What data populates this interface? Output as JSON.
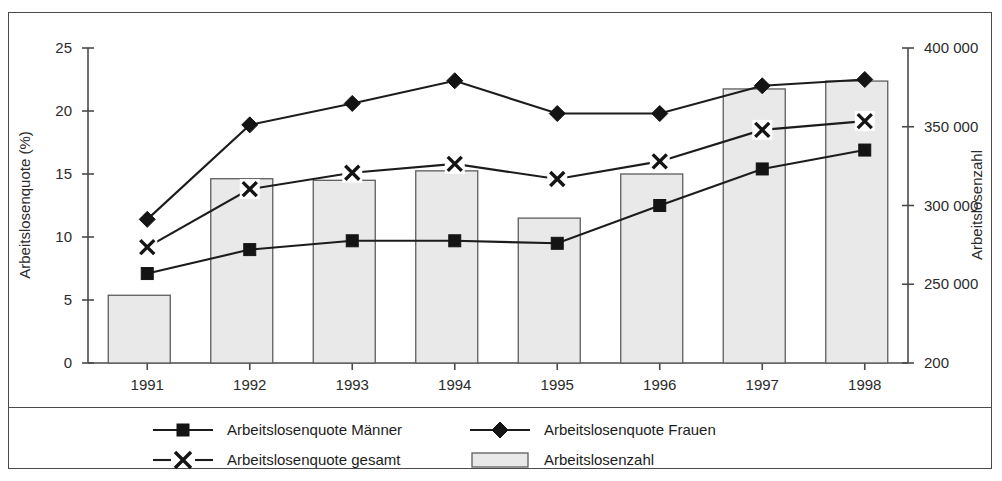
{
  "chart_data": {
    "type": "bar",
    "title": "",
    "subtitle": "",
    "categories": [
      "1991",
      "1992",
      "1993",
      "1994",
      "1995",
      "1996",
      "1997",
      "1998"
    ],
    "xlabel": "",
    "ylabel": "Arbeitslosenquote (%)",
    "y2label": "Arbeitslosenzahl",
    "ylim": [
      0,
      25
    ],
    "y2lim": [
      200000,
      400000
    ],
    "yticks": [
      "0",
      "5",
      "10",
      "15",
      "20",
      "25"
    ],
    "ytick_values": [
      0,
      5,
      10,
      15,
      20,
      25
    ],
    "y2ticks": [
      "200",
      "250 000",
      "300 000",
      "350 000",
      "400 000"
    ],
    "y2tick_values": [
      200000,
      250000,
      300000,
      350000,
      400000
    ],
    "grid": false,
    "legend_position": "bottom",
    "series": [
      {
        "name": "Arbeitslosenzahl",
        "type": "bar",
        "axis": "right",
        "marker": "bar",
        "values": [
          243000,
          317000,
          316000,
          322000,
          292000,
          320000,
          374000,
          379000
        ]
      },
      {
        "name": "Arbeitslosenquote Frauen",
        "type": "line",
        "axis": "left",
        "marker": "diamond",
        "values": [
          11.4,
          18.9,
          20.6,
          22.4,
          19.8,
          19.8,
          22.0,
          22.5
        ]
      },
      {
        "name": "Arbeitslosenquote gesamt",
        "type": "line",
        "axis": "left",
        "marker": "x",
        "values": [
          9.2,
          13.8,
          15.1,
          15.8,
          14.6,
          16.0,
          18.5,
          19.2
        ]
      },
      {
        "name": "Arbeitslosenquote Männer",
        "type": "line",
        "axis": "left",
        "marker": "square",
        "values": [
          7.1,
          9.0,
          9.7,
          9.7,
          9.5,
          12.5,
          15.4,
          16.9
        ]
      }
    ],
    "legend": [
      {
        "label": "Arbeitslosenquote Männer",
        "marker": "square"
      },
      {
        "label": "Arbeitslosenquote Frauen",
        "marker": "diamond"
      },
      {
        "label": "Arbeitslosenquote gesamt",
        "marker": "x"
      },
      {
        "label": "Arbeitslosenzahl",
        "marker": "bar"
      }
    ],
    "colors": {
      "bar_fill": "#e9e9e9",
      "bar_stroke": "#5d5d5d",
      "line": "#1c1c1c",
      "axis": "#4a4a4a",
      "text": "#2b2b2b",
      "background": "#ffffff"
    }
  }
}
